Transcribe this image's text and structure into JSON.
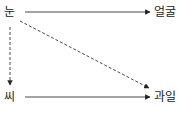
{
  "diagram": {
    "nodes": [
      {
        "id": "eye",
        "label": "눈"
      },
      {
        "id": "face",
        "label": "얼굴"
      },
      {
        "id": "seed",
        "label": "씨"
      },
      {
        "id": "fruit",
        "label": "과일"
      }
    ],
    "edges": [
      {
        "from": "눈",
        "to": "얼굴",
        "style": "solid"
      },
      {
        "from": "눈",
        "to": "과일",
        "style": "dashed"
      },
      {
        "from": "눈",
        "to": "씨",
        "style": "dashed"
      },
      {
        "from": "씨",
        "to": "과일",
        "style": "solid"
      }
    ],
    "colors": {
      "line": "#333333",
      "text": "#222222"
    }
  }
}
